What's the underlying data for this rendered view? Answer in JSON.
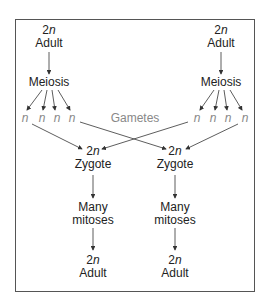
{
  "diagram": {
    "left_parent": {
      "ploidy_num": "2",
      "ploidy_var": "n",
      "label": "Adult",
      "process": "Meiosis"
    },
    "right_parent": {
      "ploidy_num": "2",
      "ploidy_var": "n",
      "label": "Adult",
      "process": "Meiosis"
    },
    "gamete_symbol": "n",
    "gametes_label": "Gametes",
    "left_zygote": {
      "ploidy_num": "2",
      "ploidy_var": "n",
      "label": "Zygote",
      "process_line1": "Many",
      "process_line2": "mitoses",
      "adult_ploidy_num": "2",
      "adult_ploidy_var": "n",
      "adult_label": "Adult"
    },
    "right_zygote": {
      "ploidy_num": "2",
      "ploidy_var": "n",
      "label": "Zygote",
      "process_line1": "Many",
      "process_line2": "mitoses",
      "adult_ploidy_num": "2",
      "adult_ploidy_var": "n",
      "adult_label": "Adult"
    },
    "colors": {
      "text": "#222222",
      "gamete_text": "#888888",
      "arrows": "#333333",
      "frame": "#555555"
    }
  }
}
